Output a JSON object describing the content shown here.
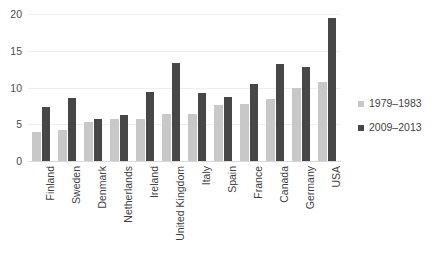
{
  "chart_data": {
    "type": "bar",
    "title": "",
    "xlabel": "",
    "ylabel": "",
    "ylim": [
      0,
      20
    ],
    "yticks": [
      0,
      5,
      10,
      15,
      20
    ],
    "grid": true,
    "legend_position": "right",
    "categories": [
      "Finland",
      "Sweden",
      "Denmark",
      "Netherlands",
      "Ireland",
      "United Kingdom",
      "Italy",
      "Spain",
      "France",
      "Canada",
      "Germany",
      "USA"
    ],
    "series": [
      {
        "name": "1979–1983",
        "color": "#c8c8c8",
        "values": [
          4.0,
          4.2,
          5.3,
          5.7,
          5.7,
          6.4,
          6.4,
          7.6,
          7.8,
          8.4,
          10.0,
          10.8
        ]
      },
      {
        "name": "2009–2013",
        "color": "#474747",
        "values": [
          7.3,
          8.6,
          5.7,
          6.2,
          9.4,
          13.4,
          9.2,
          8.7,
          10.5,
          13.2,
          12.8,
          19.4
        ]
      }
    ]
  },
  "colors": {
    "series1": "#c8c8c8",
    "series2": "#474747",
    "axis": "#d9d9d9",
    "gridline": "#efefef",
    "text": "#3f3f3f",
    "background": "#ffffff"
  }
}
